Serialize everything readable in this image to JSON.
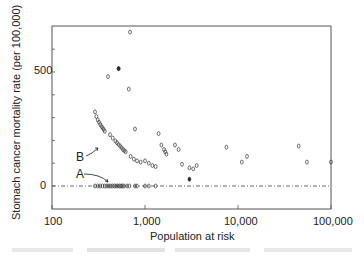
{
  "chart_data": {
    "type": "scatter",
    "title": "",
    "xlabel": "Population at risk",
    "ylabel": "Stomach cancer mortality rate  (per 100,000)",
    "xscale": "log",
    "xlim": [
      100,
      100000
    ],
    "ylim": [
      -100,
      700
    ],
    "x_ticks": [
      "100",
      "1,000",
      "10,000",
      "100,000"
    ],
    "y_ticks": [
      "0",
      "500"
    ],
    "grid": false,
    "reference_line": {
      "y": 0,
      "style": "dash-dot"
    },
    "annotations": [
      {
        "label": "A",
        "points_to": "row of zero-rate points",
        "x": 380,
        "y": 0
      },
      {
        "label": "B",
        "points_to": "descending curve of smallest non-zero rates",
        "x": 380,
        "y": 250
      }
    ],
    "series": [
      {
        "name": "counties",
        "marker": "open-oval",
        "points": [
          [
            690,
            675
          ],
          [
            520,
            515
          ],
          [
            400,
            480
          ],
          [
            670,
            425
          ],
          [
            290,
            325
          ],
          [
            300,
            305
          ],
          [
            310,
            290
          ],
          [
            320,
            280
          ],
          [
            330,
            270
          ],
          [
            340,
            262
          ],
          [
            350,
            255
          ],
          [
            360,
            248
          ],
          [
            370,
            240
          ],
          [
            420,
            225
          ],
          [
            450,
            210
          ],
          [
            480,
            198
          ],
          [
            500,
            190
          ],
          [
            520,
            182
          ],
          [
            540,
            175
          ],
          [
            560,
            168
          ],
          [
            580,
            160
          ],
          [
            600,
            155
          ],
          [
            620,
            150
          ],
          [
            700,
            130
          ],
          [
            760,
            118
          ],
          [
            820,
            110
          ],
          [
            900,
            105
          ],
          [
            780,
            250
          ],
          [
            1000,
            110
          ],
          [
            1100,
            100
          ],
          [
            1200,
            90
          ],
          [
            1300,
            85
          ],
          [
            1400,
            230
          ],
          [
            1500,
            180
          ],
          [
            1600,
            160
          ],
          [
            1650,
            150
          ],
          [
            1700,
            140
          ],
          [
            2100,
            180
          ],
          [
            2300,
            160
          ],
          [
            2500,
            95
          ],
          [
            3000,
            80
          ],
          [
            3300,
            75
          ],
          [
            3600,
            90
          ],
          [
            7500,
            170
          ],
          [
            11000,
            105
          ],
          [
            12500,
            130
          ],
          [
            45000,
            175
          ],
          [
            55000,
            105
          ],
          [
            100000,
            105
          ]
        ]
      },
      {
        "name": "filled",
        "marker": "filled-oval",
        "points": [
          [
            520,
            515
          ],
          [
            3000,
            30
          ]
        ]
      },
      {
        "name": "zero-rate counties (A)",
        "marker": "open-oval",
        "points": [
          [
            290,
            0
          ],
          [
            310,
            0
          ],
          [
            330,
            0
          ],
          [
            350,
            0
          ],
          [
            370,
            0
          ],
          [
            390,
            0
          ],
          [
            410,
            0
          ],
          [
            430,
            0
          ],
          [
            450,
            0
          ],
          [
            470,
            0
          ],
          [
            490,
            0
          ],
          [
            510,
            0
          ],
          [
            530,
            0
          ],
          [
            550,
            0
          ],
          [
            570,
            0
          ],
          [
            590,
            0
          ],
          [
            640,
            0
          ],
          [
            680,
            0
          ],
          [
            780,
            0
          ],
          [
            820,
            0
          ],
          [
            1000,
            0
          ],
          [
            1100,
            0
          ],
          [
            1300,
            0
          ]
        ]
      }
    ]
  },
  "labels": {
    "x_axis": "Population at risk",
    "y_axis": "Stomach cancer mortality rate  (per 100,000)",
    "y_tick_0": "0",
    "y_tick_500": "500",
    "x_tick_100": "100",
    "x_tick_1000": "1,000",
    "x_tick_10000": "10,000",
    "x_tick_100000": "100,000",
    "annot_a": "A",
    "annot_b": "B"
  }
}
